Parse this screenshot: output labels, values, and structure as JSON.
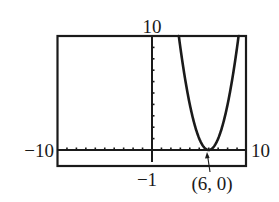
{
  "chart_data": {
    "type": "line",
    "title": "",
    "xlabel": "",
    "ylabel": "",
    "xlim": [
      -10,
      10
    ],
    "ylim": [
      -1,
      10
    ],
    "x_tick_step": 1,
    "y_tick_step": 1,
    "grid": false,
    "legend": null,
    "series": [
      {
        "name": "parabola",
        "equation": "y = (x - 6)^2",
        "x": [
          2.8,
          3,
          3.5,
          4,
          4.5,
          5,
          5.5,
          6,
          6.5,
          7,
          7.5,
          8,
          8.5,
          9,
          9.2
        ],
        "y": [
          10.24,
          9,
          6.25,
          4,
          2.25,
          1,
          0.25,
          0,
          0.25,
          1,
          2.25,
          4,
          6.25,
          9,
          10.24
        ]
      }
    ],
    "annotations": [
      {
        "text": "(6, 0)",
        "x": 6,
        "y": 0,
        "arrow": true
      }
    ],
    "window_labels": {
      "xmin": "−10",
      "xmax": "10",
      "ymin": "−1",
      "ymax": "10"
    }
  },
  "labels": {
    "ymax": "10",
    "xmin": "−10",
    "xmax": "10",
    "ymin": "−1",
    "point": "(6, 0)"
  },
  "colors": {
    "ink": "#1a1a1a",
    "background": "#ffffff"
  }
}
